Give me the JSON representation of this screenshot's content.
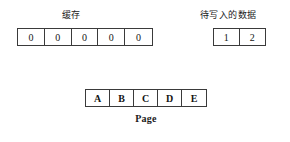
{
  "diagram": {
    "background_color": "#ffffff",
    "border_color": "#3a3a3a",
    "text_color": "#141414",
    "cache": {
      "label": "缓存",
      "cells": [
        "0",
        "0",
        "0",
        "0",
        "0"
      ]
    },
    "pending_data": {
      "label": "待写入的数据",
      "cells": [
        "1",
        "2"
      ]
    },
    "page": {
      "label": "Page",
      "cells": [
        "A",
        "B",
        "C",
        "D",
        "E"
      ]
    }
  }
}
